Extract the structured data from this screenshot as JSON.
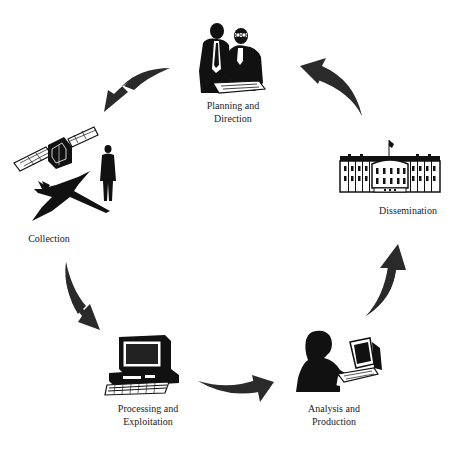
{
  "diagram": {
    "type": "cycle",
    "colors": {
      "ink": "#111111",
      "arrow": "#2a2a2a",
      "background": "#ffffff"
    },
    "stages": [
      {
        "id": "planning",
        "line1": "Planning and",
        "line2": "Direction",
        "icon": "two-men-reviewing-documents-icon"
      },
      {
        "id": "collection",
        "line1": "Collection",
        "line2": "",
        "icon": "satellite-aircraft-person-icon"
      },
      {
        "id": "processing",
        "line1": "Processing and",
        "line2": "Exploitation",
        "icon": "desktop-computer-icon"
      },
      {
        "id": "analysis",
        "line1": "Analysis and",
        "line2": "Production",
        "icon": "analyst-at-computer-icon"
      },
      {
        "id": "dissemination",
        "line1": "Dissemination",
        "line2": "",
        "icon": "white-house-icon"
      }
    ],
    "arrows": [
      {
        "from": "planning",
        "to": "collection"
      },
      {
        "from": "collection",
        "to": "processing"
      },
      {
        "from": "processing",
        "to": "analysis"
      },
      {
        "from": "analysis",
        "to": "dissemination"
      },
      {
        "from": "dissemination",
        "to": "planning"
      }
    ]
  }
}
